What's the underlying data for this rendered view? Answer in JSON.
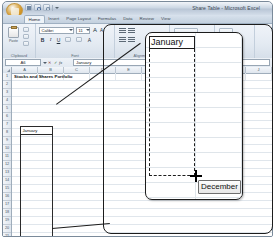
{
  "window": {
    "title": "Share Table - Microsoft Excel",
    "orb_label": "Office Button",
    "quick_access": [
      {
        "name": "save",
        "label": "Save"
      },
      {
        "name": "undo",
        "label": "Undo"
      },
      {
        "name": "redo",
        "label": "Redo"
      },
      {
        "name": "customize",
        "label": "Customize Quick Access Toolbar"
      }
    ]
  },
  "ribbon": {
    "tabs": [
      {
        "label": "Home",
        "active": true
      },
      {
        "label": "Insert",
        "active": false
      },
      {
        "label": "Page Layout",
        "active": false
      },
      {
        "label": "Formulas",
        "active": false
      },
      {
        "label": "Data",
        "active": false
      },
      {
        "label": "Review",
        "active": false
      },
      {
        "label": "View",
        "active": false
      }
    ],
    "groups": [
      {
        "name": "clipboard",
        "label": "Clipboard"
      },
      {
        "name": "font",
        "label": "Font"
      },
      {
        "name": "alignment",
        "label": "Alignment"
      },
      {
        "name": "number",
        "label": "Number"
      },
      {
        "name": "styles",
        "label": "Styles"
      }
    ],
    "clipboard": {
      "paste_label": "Paste",
      "cut_label": "Cut",
      "copy_label": "Copy",
      "format_painter_label": "Format Painter"
    },
    "font": {
      "font_name": "Calibri",
      "font_size": "11",
      "bold": "B",
      "italic": "I",
      "underline": "U",
      "grow_font": "A",
      "shrink_font": "A",
      "borders_label": "Borders",
      "fill_label": "Fill Color",
      "fontcolor_label": "Font Color"
    }
  },
  "formula_bar": {
    "name_box": "A6",
    "cancel": "✕",
    "enter": "✓",
    "insert_function": "fx",
    "formula_value": "January"
  },
  "sheet": {
    "columns": [
      "A",
      "B",
      "C",
      "D",
      "E",
      "F",
      "G",
      "H",
      "I",
      "J"
    ],
    "rows": [
      "1",
      "2",
      "3",
      "4",
      "5",
      "6",
      "7",
      "8",
      "9",
      "10",
      "11",
      "12",
      "13",
      "14",
      "15",
      "16",
      "17",
      "18",
      "19",
      "20",
      "21"
    ],
    "title_cell": "Stocks and Shares Portfolio",
    "selection": {
      "start_cell_value": "January",
      "fill_tooltip": "December"
    }
  },
  "callout": {
    "start_cell_value": "January",
    "fill_tooltip": "December"
  }
}
